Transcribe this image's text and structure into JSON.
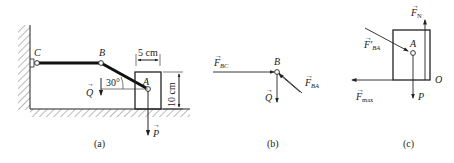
{
  "figure": {
    "panels": [
      {
        "id": "a",
        "caption": "(a)"
      },
      {
        "id": "b",
        "caption": "(b)"
      },
      {
        "id": "c",
        "caption": "(c)"
      }
    ],
    "panel_a": {
      "points": {
        "C": "C",
        "B": "B",
        "A": "A"
      },
      "angle": "30°",
      "width_dim": "5 cm",
      "height_dim": "10 cm",
      "forces": {
        "Q": "Q",
        "P": "P"
      }
    },
    "panel_b": {
      "point": "B",
      "forces": {
        "F_BC": "F",
        "F_BC_sub": "BC",
        "F_BA": "F",
        "F_BA_sub": "BA",
        "Q": "Q"
      }
    },
    "panel_c": {
      "point": "A",
      "corner": "O",
      "forces": {
        "F_N": "F",
        "F_N_sub": "N",
        "F_BA_prime": "F′",
        "F_BA_prime_sub": "BA",
        "F_max": "F",
        "F_max_sub": "max",
        "P": "P"
      }
    },
    "colors": {
      "ink": "#222222",
      "background": "#ffffff",
      "hatch": "#555555"
    }
  }
}
